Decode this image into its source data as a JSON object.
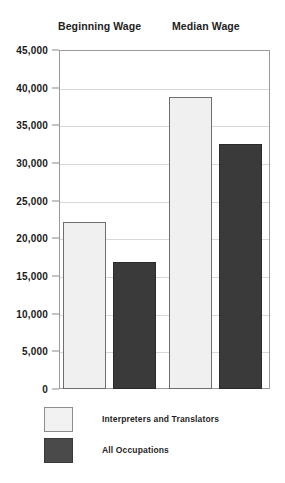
{
  "chart_data": {
    "type": "bar",
    "title": "",
    "xlabel": "",
    "ylabel": "",
    "ylim": [
      0,
      45000
    ],
    "grid": true,
    "legend_position": "bottom-left",
    "categories": [
      "Beginning Wage",
      "Median Wage"
    ],
    "y_ticks": [
      0,
      5000,
      10000,
      15000,
      20000,
      25000,
      30000,
      35000,
      40000,
      45000
    ],
    "y_tick_labels": [
      "0",
      "5,000",
      "10,000",
      "15,000",
      "20,000",
      "25,000",
      "30,000",
      "35,000",
      "40,000",
      "45,000"
    ],
    "series": [
      {
        "name": "Interpreters and Translators",
        "color": "#f0f0f0",
        "values": [
          22200,
          38800
        ]
      },
      {
        "name": "All Occupations",
        "color": "#3a3a3a",
        "values": [
          16800,
          32500
        ]
      }
    ]
  },
  "headers": [
    {
      "label": "Beginning Wage"
    },
    {
      "label": "Median Wage"
    }
  ],
  "legend": [
    {
      "label": "Interpreters and Translators",
      "swatch": "light"
    },
    {
      "label": "All Occupations",
      "swatch": "dark"
    }
  ]
}
